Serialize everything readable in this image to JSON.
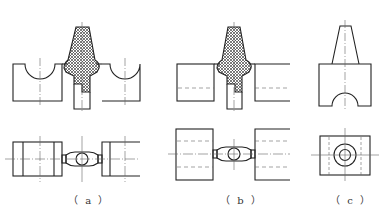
{
  "figure": {
    "colors": {
      "line": "#222222",
      "centerline": "#555555",
      "hatch": "#444444",
      "background": "#ffffff"
    },
    "panels": [
      {
        "id": "a",
        "label": "（ a ）",
        "description": "Split die with semicircular cavities, hatched tapered punch and stem; top view with paired blocks and circular connector"
      },
      {
        "id": "b",
        "label": "（ b ）",
        "description": "Rectangular dies with hidden lines, hatched tapered punch and stem; top view with dashed hidden lines and circular connector"
      },
      {
        "id": "c",
        "label": "（ c ）",
        "description": "Workpiece: tapered boss on block with semicircular arch; top view with concentric circles and hidden lines"
      }
    ]
  }
}
